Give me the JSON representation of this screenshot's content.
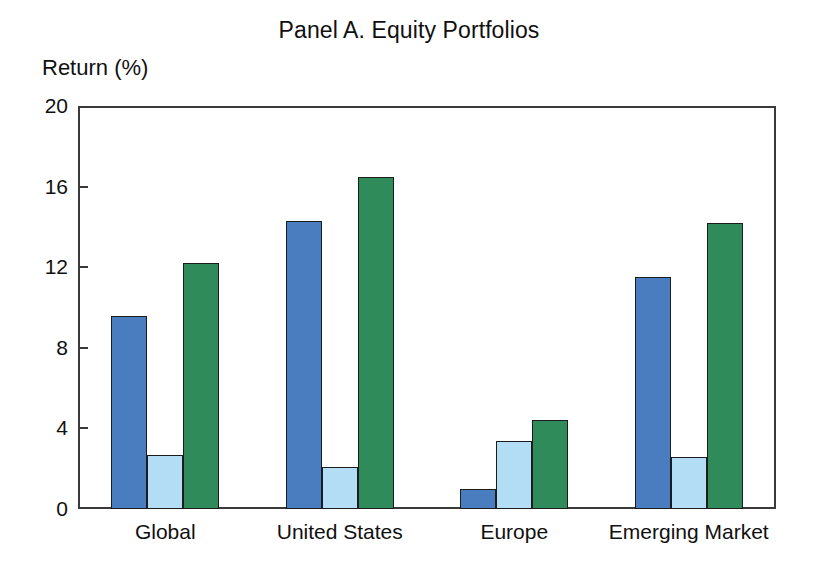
{
  "chart_data": {
    "type": "bar",
    "title": "Panel A. Equity Portfolios",
    "xlabel": "",
    "ylabel": "Return (%)",
    "ylim": [
      0,
      20
    ],
    "yticks": [
      0,
      4,
      8,
      12,
      16,
      20
    ],
    "ytick_labels": [
      "0",
      "4",
      "8",
      "12",
      "16",
      "20"
    ],
    "grid": false,
    "legend": "none",
    "categories": [
      "Global",
      "United States",
      "Europe",
      "Emerging Market"
    ],
    "series": [
      {
        "name": "series-1",
        "color": "#4a7dc0",
        "values": [
          9.6,
          14.3,
          1.0,
          11.5
        ]
      },
      {
        "name": "series-2",
        "color": "#b3ddf5",
        "values": [
          2.7,
          2.1,
          3.4,
          2.6
        ]
      },
      {
        "name": "series-3",
        "color": "#2f8b59",
        "values": [
          12.2,
          16.5,
          4.4,
          14.2
        ]
      }
    ]
  },
  "colors": {
    "series_1": "#4a7dc0",
    "series_2": "#b3ddf5",
    "series_3": "#2f8b59",
    "frame": "#3a3a3a",
    "bar_outline": "#1c1c1c",
    "text": "#101010",
    "background": "#ffffff"
  }
}
